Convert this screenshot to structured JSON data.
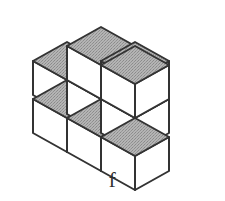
{
  "figure": {
    "label": "f",
    "kind": "isometric-cube-assembly",
    "cube_count": 9,
    "colors": {
      "outline": "#333333",
      "top_face": "#a9a9a9",
      "left_face": "#ffffff",
      "right_face": "#ffffff",
      "background": "#ffffff",
      "label_text": "#2e2e2e"
    },
    "projection": {
      "origin_x": 33,
      "origin_y": 95,
      "unit_x_dx": 34,
      "unit_x_dy": 19,
      "unit_y_dx": 34,
      "unit_y_dy": -19,
      "unit_z_dy": -34
    },
    "cubes": [
      {
        "name": "back-left-lower",
        "x": 0,
        "y": 0,
        "z": 0
      },
      {
        "name": "back-middle-lower",
        "x": 1,
        "y": 0,
        "z": 0
      },
      {
        "name": "back-right-lower",
        "x": 2,
        "y": 0,
        "z": 0
      },
      {
        "name": "front-middle-lower",
        "x": 1,
        "y": -1,
        "z": 0
      },
      {
        "name": "front-right-lower",
        "x": 2,
        "y": -1,
        "z": 0
      },
      {
        "name": "front-far-right-lower",
        "x": 3,
        "y": -1,
        "z": 0
      },
      {
        "name": "back-middle-upper",
        "x": 1,
        "y": 0,
        "z": 1
      },
      {
        "name": "back-right-upper",
        "x": 2,
        "y": 0,
        "z": 1
      },
      {
        "name": "back-left-upper-riser",
        "x": 1,
        "y": 1,
        "z": 0
      }
    ]
  }
}
